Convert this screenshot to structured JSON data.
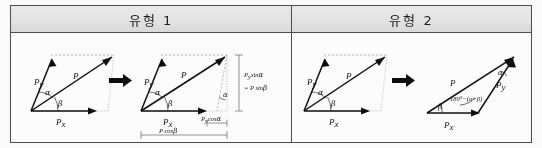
{
  "table": {
    "headers": [
      {
        "label": "유형 1"
      },
      {
        "label": "유형 2"
      }
    ]
  },
  "figures": [
    {
      "id": "type1-step1",
      "kind": "parallelogram-vector-decomposition",
      "labels": {
        "py": "P",
        "py_sub": "y",
        "p": "P",
        "px": "P",
        "px_sub": "x",
        "alpha": "α",
        "beta": "β"
      }
    },
    {
      "id": "type1-step2",
      "kind": "parallelogram-with-projections",
      "labels": {
        "py": "P",
        "py_sub": "y",
        "p": "P",
        "px": "P",
        "px_sub": "x",
        "alpha": "α",
        "alpha2": "α",
        "beta": "β",
        "vertical_1": "P",
        "vertical_1_sub": "y",
        "vertical_1_rest": "sin",
        "vertical_1_angle": "α",
        "vertical_2": "= P sin",
        "vertical_2_angle": "β",
        "dim_small": "P",
        "dim_small_sub": "y",
        "dim_small_rest": "cos",
        "dim_small_angle": "α",
        "dim_big": "P cos",
        "dim_big_angle": "β"
      }
    },
    {
      "id": "type2-step1",
      "kind": "parallelogram-vector-decomposition",
      "labels": {
        "py": "P",
        "py_sub": "y",
        "p": "P",
        "px": "P",
        "px_sub": "x",
        "alpha": "α",
        "beta": "β"
      }
    },
    {
      "id": "type2-step2",
      "kind": "triangle-vector-decomposition",
      "labels": {
        "p": "P",
        "py": "P",
        "py_sub": "y",
        "px": "P",
        "px_sub": "x",
        "alpha": "α",
        "beta": "β",
        "interior_angle": "180°−(α+β)"
      }
    }
  ],
  "arrows": [
    {
      "id": "arrow-step1-to-step2-type1",
      "glyph": "→"
    },
    {
      "id": "arrow-step1-to-step2-type2",
      "glyph": "→"
    }
  ],
  "colors": {
    "border": "#4a4a4a",
    "header_fill": "#e6e6e6",
    "ink": "#0d0d0d",
    "construction": "#9a9a9a"
  }
}
